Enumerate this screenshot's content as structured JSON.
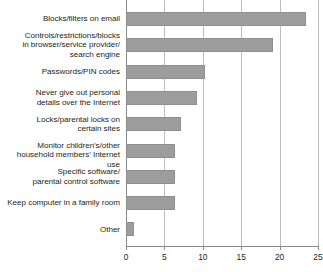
{
  "chart_data": {
    "type": "bar",
    "orientation": "horizontal",
    "title": "",
    "xlabel": "",
    "ylabel": "",
    "xlim": [
      0,
      25
    ],
    "xticks": [
      0,
      5,
      10,
      15,
      20,
      25
    ],
    "tick_labels": [
      "0",
      "5",
      "10",
      "15",
      "20",
      "25"
    ],
    "grid": true,
    "legend": "none",
    "bar_color": "#9d9d9d",
    "categories": [
      "Blocks/filters on email",
      "Controls/restrictions/blocks in browser/service provider/ search engine",
      "Passwords/PIN codes",
      "Never give out personal details over the Internet",
      "Locks/parental locks on certain sites",
      "Monitor children's/other household members' Internet use",
      "Specific software/ parental control software",
      "Keep computer in a family room",
      "Other"
    ],
    "values": [
      23.4,
      19.2,
      10.3,
      9.3,
      7.2,
      6.4,
      6.4,
      6.4,
      1.1
    ]
  },
  "labels": {
    "row_0": [
      "Blocks/filters on email"
    ],
    "row_1": [
      "Controls/restrictions/blocks",
      "in browser/service provider/",
      "search engine"
    ],
    "row_2": [
      "Passwords/PIN codes"
    ],
    "row_3": [
      "Never give out personal",
      "details over the Internet"
    ],
    "row_4": [
      "Locks/parental locks on",
      "certain sites"
    ],
    "row_5": [
      "Monitor children's/other",
      "household members' Internet use"
    ],
    "row_6": [
      "Specific software/",
      "parental control software"
    ],
    "row_7": [
      "Keep computer in a family room"
    ],
    "row_8": [
      "Other"
    ]
  }
}
